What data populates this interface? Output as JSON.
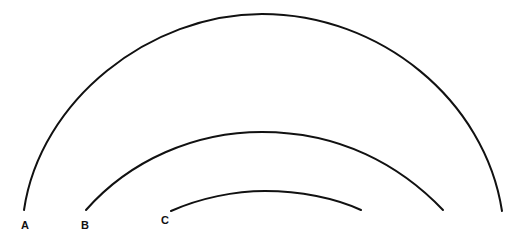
{
  "diagram": {
    "type": "nested-arcs",
    "arcs": [
      {
        "id": "A",
        "label": "A",
        "left": [
          24,
          210
        ],
        "top": [
          262,
          14
        ],
        "right": [
          502,
          211
        ]
      },
      {
        "id": "B",
        "label": "B",
        "left": [
          86,
          210
        ],
        "top": [
          262,
          132
        ],
        "right": [
          443,
          210
        ]
      },
      {
        "id": "C",
        "label": "C",
        "left": [
          171,
          211
        ],
        "top": [
          265,
          191
        ],
        "right": [
          361,
          210
        ]
      }
    ],
    "stroke_color": "#111111",
    "background": "#ffffff"
  }
}
